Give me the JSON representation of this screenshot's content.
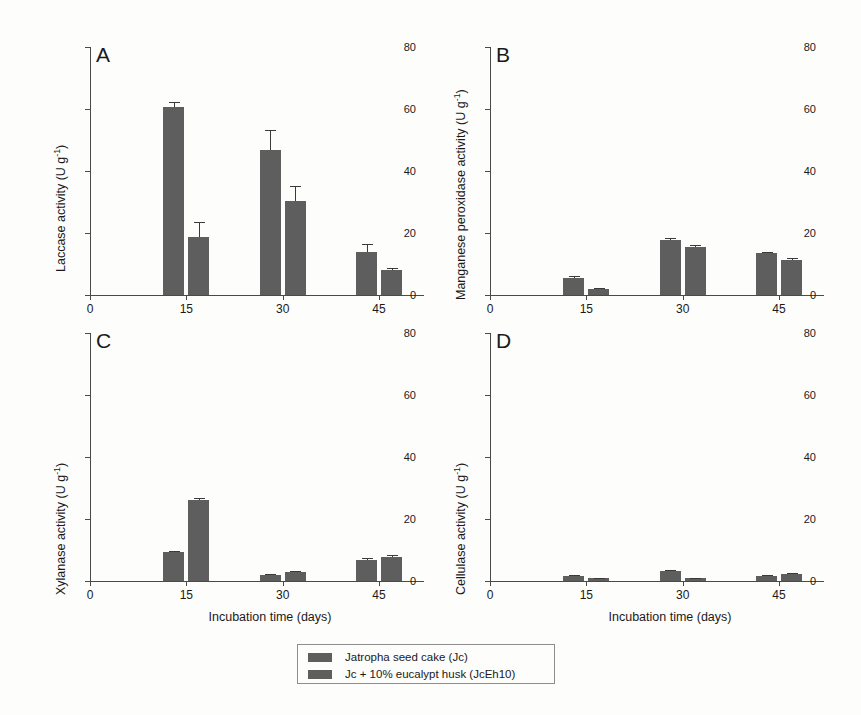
{
  "figure": {
    "background": "#fdfdfb",
    "bar_color": "#5e5e5e",
    "axis_color": "#4a4a4a"
  },
  "axis": {
    "x_label": "Incubation time (days)",
    "x_ticks": [
      "0",
      "15",
      "30",
      "45"
    ],
    "x_tick_values": [
      0,
      15,
      30,
      45
    ],
    "x_min": 0,
    "x_max": 52,
    "y_ticks": [
      "0",
      "20",
      "40",
      "60",
      "80"
    ],
    "y_tick_values": [
      0,
      20,
      40,
      60,
      80
    ],
    "y_min": 0,
    "y_max": 80
  },
  "legend": {
    "position": "bottom-center",
    "entries": [
      {
        "label": "Jatropha seed cake (Jc)",
        "color": "#5e5e5e"
      },
      {
        "label": "Jc + 10% eucalypt husk (JcEh10)",
        "color": "#5e5e5e"
      }
    ]
  },
  "panels": [
    {
      "letter": "A",
      "y_label": "Laccase activity (U g",
      "y_label_sup": "-1",
      "y_label_tail": ")"
    },
    {
      "letter": "B",
      "y_label": "Manganese peroxidase  activity (U g",
      "y_label_sup": "-1",
      "y_label_tail": ")"
    },
    {
      "letter": "C",
      "y_label": "Xylanase activity (U g",
      "y_label_sup": "-1",
      "y_label_tail": ")"
    },
    {
      "letter": "D",
      "y_label": "Cellulase activity (U g",
      "y_label_sup": "-1",
      "y_label_tail": ")"
    }
  ],
  "chart_data": [
    {
      "type": "bar",
      "panel": "A",
      "title": "Laccase activity",
      "xlabel": "Incubation time (days)",
      "ylabel": "Laccase activity (U g-1)",
      "categories": [
        15,
        30,
        45
      ],
      "xlim": [
        0,
        52
      ],
      "ylim": [
        0,
        80
      ],
      "grid": false,
      "series": [
        {
          "name": "Jatropha seed cake (Jc)",
          "values": [
            60.8,
            46.8,
            13.8
          ],
          "errors": [
            1.5,
            6.5,
            2.6
          ]
        },
        {
          "name": "Jc + 10% eucalypt husk (JcEh10)",
          "values": [
            18.7,
            30.4,
            8.0
          ],
          "errors": [
            5.0,
            4.8,
            0.7
          ]
        }
      ]
    },
    {
      "type": "bar",
      "panel": "B",
      "title": "Manganese peroxidase activity",
      "xlabel": "Incubation time (days)",
      "ylabel": "Manganese peroxidase activity (U g-1)",
      "categories": [
        15,
        30,
        45
      ],
      "xlim": [
        0,
        52
      ],
      "ylim": [
        0,
        80
      ],
      "grid": false,
      "series": [
        {
          "name": "Jatropha seed cake (Jc)",
          "values": [
            5.6,
            17.8,
            13.6
          ],
          "errors": [
            0.5,
            0.6,
            0.4
          ]
        },
        {
          "name": "Jc + 10% eucalypt husk (JcEh10)",
          "values": [
            1.8,
            15.6,
            11.3
          ],
          "errors": [
            0.3,
            0.4,
            0.6
          ]
        }
      ]
    },
    {
      "type": "bar",
      "panel": "C",
      "title": "Xylanase activity",
      "xlabel": "Incubation time (days)",
      "ylabel": "Xylanase activity (U g-1)",
      "categories": [
        15,
        30,
        45
      ],
      "xlim": [
        0,
        52
      ],
      "ylim": [
        0,
        80
      ],
      "grid": false,
      "series": [
        {
          "name": "Jatropha seed cake (Jc)",
          "values": [
            9.3,
            1.8,
            6.9
          ],
          "errors": [
            0.4,
            0.3,
            0.5
          ]
        },
        {
          "name": "Jc + 10% eucalypt husk (JcEh10)",
          "values": [
            26.2,
            2.8,
            7.9
          ],
          "errors": [
            0.6,
            0.3,
            0.4
          ]
        }
      ]
    },
    {
      "type": "bar",
      "panel": "D",
      "title": "Cellulase activity",
      "xlabel": "Incubation time (days)",
      "ylabel": "Cellulase activity (U g-1)",
      "categories": [
        15,
        30,
        45
      ],
      "xlim": [
        0,
        52
      ],
      "ylim": [
        0,
        80
      ],
      "grid": false,
      "series": [
        {
          "name": "Jatropha seed cake (Jc)",
          "values": [
            1.5,
            3.2,
            1.6
          ],
          "errors": [
            0.5,
            0.5,
            0.3
          ]
        },
        {
          "name": "Jc + 10% eucalypt husk (JcEh10)",
          "values": [
            0.9,
            0.9,
            2.2
          ],
          "errors": [
            0.2,
            0.2,
            0.4
          ]
        }
      ]
    }
  ]
}
